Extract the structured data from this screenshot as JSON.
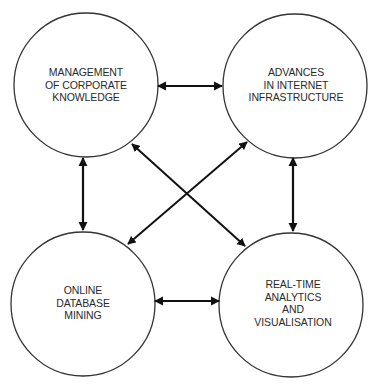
{
  "diagram": {
    "type": "relationship-diagram",
    "colors": {
      "stroke": "#333333",
      "arrow": "#111111",
      "text": "#2a2a2a",
      "background": "#ffffff"
    },
    "nodes": [
      {
        "id": "management",
        "lines": [
          "MANAGEMENT",
          "OF CORPORATE",
          "KNOWLEDGE"
        ]
      },
      {
        "id": "internet",
        "lines": [
          "ADVANCES",
          "IN INTERNET",
          "INFRASTRUCTURE"
        ]
      },
      {
        "id": "database",
        "lines": [
          "ONLINE",
          "DATABASE",
          "MINING"
        ]
      },
      {
        "id": "analytics",
        "lines": [
          "REAL-TIME",
          "ANALYTICS",
          "AND",
          "VISUALISATION"
        ]
      }
    ],
    "edges": [
      {
        "from": "management",
        "to": "internet",
        "bidirectional": true
      },
      {
        "from": "management",
        "to": "database",
        "bidirectional": true
      },
      {
        "from": "internet",
        "to": "analytics",
        "bidirectional": true
      },
      {
        "from": "database",
        "to": "analytics",
        "bidirectional": true
      },
      {
        "from": "management",
        "to": "analytics",
        "bidirectional": true
      },
      {
        "from": "internet",
        "to": "database",
        "bidirectional": true
      }
    ]
  }
}
